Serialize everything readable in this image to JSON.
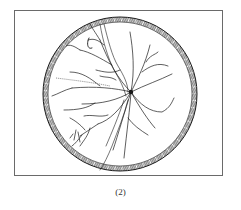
{
  "figure": {
    "caption": "(2)",
    "colors": {
      "ink": "#1a1a1a",
      "frame": "#6a6a6a",
      "background": "#ffffff"
    }
  }
}
